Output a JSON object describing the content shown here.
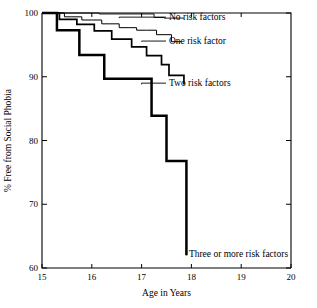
{
  "chart_data": {
    "type": "line",
    "subtype": "kaplan-meier-survival-step",
    "title": "",
    "xlabel": "Age in Years",
    "ylabel": "% Free from Social Phobia",
    "xlim": [
      15,
      20
    ],
    "ylim": [
      60,
      100
    ],
    "xticks": [
      15,
      16,
      17,
      18,
      19,
      20
    ],
    "xtick_labels": [
      "15",
      "16",
      "17",
      "18",
      "19",
      "20"
    ],
    "yticks": [
      60,
      70,
      80,
      90,
      100
    ],
    "ytick_labels": [
      "60",
      "70",
      "80",
      "90",
      "100"
    ],
    "grid": false,
    "legend_position": "inline-right-labels",
    "series": [
      {
        "name": "No risk factors",
        "label": "No risk factors",
        "stroke_width": 0.9,
        "label_x": 17.55,
        "label_y": 99.35,
        "leader_from_x": 16.55,
        "leader_from_y": 99.2,
        "x": [
          15.0,
          15.35,
          16.15,
          17.15,
          17.25,
          17.45,
          17.85
        ],
        "y": [
          100.0,
          100.0,
          99.85,
          99.85,
          99.3,
          99.2,
          99.2
        ]
      },
      {
        "name": "One risk factor",
        "label": "One risk factor",
        "stroke_width": 1.0,
        "label_x": 17.55,
        "label_y": 95.6,
        "leader_from_x": 17.0,
        "leader_from_y": 95.5,
        "x": [
          15.0,
          15.3,
          15.45,
          15.6,
          15.8,
          16.0,
          16.2,
          16.35,
          16.55,
          16.75,
          16.9,
          17.1,
          17.3,
          17.45,
          17.6,
          17.8
        ],
        "y": [
          100.0,
          100.0,
          99.4,
          99.4,
          98.9,
          98.9,
          98.3,
          98.3,
          97.7,
          97.7,
          97.3,
          97.3,
          96.6,
          96.6,
          95.5,
          95.5
        ]
      },
      {
        "name": "Two risk factors",
        "label": "Two risk factors",
        "stroke_width": 1.7,
        "label_x": 17.55,
        "label_y": 89.0,
        "leader_from_x": 17.0,
        "leader_from_y": 88.8,
        "x": [
          15.0,
          15.2,
          15.35,
          15.5,
          15.7,
          15.85,
          16.05,
          16.25,
          16.4,
          16.6,
          16.8,
          16.95,
          17.1,
          17.25,
          17.4,
          17.55,
          17.7,
          17.85
        ],
        "y": [
          100.0,
          100.0,
          99.0,
          99.0,
          98.2,
          98.2,
          97.2,
          97.2,
          95.9,
          95.9,
          94.7,
          94.7,
          93.3,
          93.3,
          91.9,
          90.2,
          90.2,
          88.8
        ]
      },
      {
        "name": "Three or more risk factors",
        "label": "Three or more risk factors",
        "stroke_width": 2.5,
        "label_x": 17.95,
        "label_y": 62.3,
        "leader_from_x": 17.9,
        "leader_from_y": 62.0,
        "x": [
          15.0,
          15.15,
          15.3,
          15.55,
          15.75,
          16.1,
          16.25,
          17.05,
          17.2,
          17.35,
          17.5,
          17.85,
          17.9
        ],
        "y": [
          100.0,
          100.0,
          97.3,
          97.3,
          93.4,
          93.4,
          89.7,
          89.7,
          83.9,
          83.9,
          76.8,
          76.8,
          62.0
        ]
      }
    ]
  },
  "axes": {
    "x_axis_title": "Age in Years",
    "y_axis_title": "% Free from Social Phobia"
  }
}
